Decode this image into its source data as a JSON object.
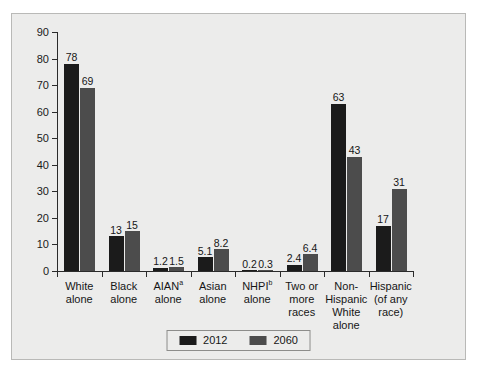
{
  "chart_data": {
    "type": "bar",
    "title": "",
    "subtitle": "",
    "xlabel": "",
    "ylabel": "",
    "ylim": [
      0,
      90
    ],
    "ytick_step": 10,
    "grid": false,
    "legend_position": "bottom-center",
    "categories": [
      "White\nalone",
      "Black\nalone",
      "AIAN\nalone",
      "Asian\nalone",
      "NHPI\nalone",
      "Two or\nmore\nraces",
      "Non-\nHispanic\nWhite\nalone",
      "Hispanic\n(of any\nrace)"
    ],
    "category_superscripts": [
      "",
      "",
      "a",
      "",
      "b",
      "",
      "",
      ""
    ],
    "yticks": [
      "0",
      "10",
      "20",
      "30",
      "40",
      "50",
      "60",
      "70",
      "80",
      "90"
    ],
    "series": [
      {
        "name": "2012",
        "color": "#1b1b1b",
        "values": [
          78,
          13,
          1.2,
          5.1,
          0.2,
          2.4,
          63,
          17
        ],
        "labels": [
          "78",
          "13",
          "1.2",
          "5.1",
          "0.2",
          "2.4",
          "63",
          "17"
        ]
      },
      {
        "name": "2060",
        "color": "#4c4c4c",
        "values": [
          69,
          15,
          1.5,
          8.2,
          0.3,
          6.4,
          43,
          31
        ],
        "labels": [
          "69",
          "15",
          "1.5",
          "8.2",
          "0.3",
          "6.4",
          "43",
          "31"
        ]
      }
    ]
  },
  "legend": {
    "items": [
      {
        "label": "2012",
        "color": "#1b1b1b"
      },
      {
        "label": "2060",
        "color": "#4c4c4c"
      }
    ]
  },
  "colors": {
    "panel_background": "#ececeb",
    "panel_border": "#b9b9b7",
    "axis": "#2b2b2b",
    "series_2012": "#1b1b1b",
    "series_2060": "#4c4c4c",
    "text": "#161616"
  }
}
